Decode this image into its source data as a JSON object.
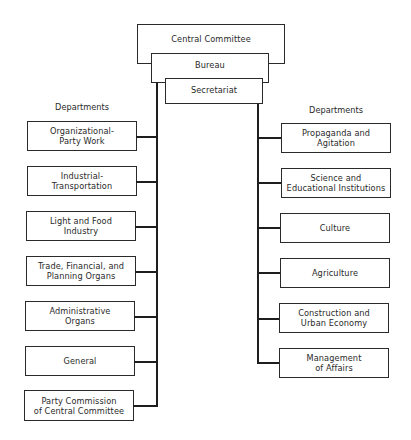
{
  "chart_title": "",
  "top": {
    "central_committee": "Central Committee",
    "bureau": "Bureau",
    "secretariat": "Secretariat"
  },
  "left": {
    "heading": "Departments",
    "boxes": [
      {
        "line1": "Organizational-",
        "line2": "Party Work"
      },
      {
        "line1": "Industrial-",
        "line2": "Transportation"
      },
      {
        "line1": "Light and Food",
        "line2": "Industry"
      },
      {
        "line1": "Trade, Financial, and",
        "line2": "Planning Organs"
      },
      {
        "line1": "Administrative",
        "line2": "Organs"
      },
      {
        "line1": "General",
        "line2": ""
      },
      {
        "line1": "Party Commission",
        "line2": "of Central Committee"
      }
    ]
  },
  "right": {
    "heading": "Departments",
    "boxes": [
      {
        "line1": "Propaganda and",
        "line2": "Agitation"
      },
      {
        "line1": "Science and",
        "line2": "Educational Institutions"
      },
      {
        "line1": "Culture",
        "line2": ""
      },
      {
        "line1": "Agriculture",
        "line2": ""
      },
      {
        "line1": "Construction and",
        "line2": "Urban Economy"
      },
      {
        "line1": "Management",
        "line2": "of Affairs"
      }
    ]
  }
}
